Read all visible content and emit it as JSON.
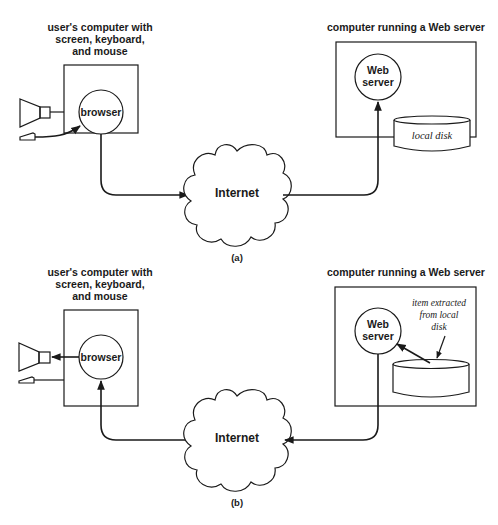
{
  "figure": {
    "panels": [
      {
        "id": "a",
        "caption": "(a)",
        "client": {
          "title_lines": [
            "user's computer with",
            "screen, keyboard,",
            "and mouse"
          ],
          "process_label": "browser",
          "devices": [
            "monitor-icon",
            "mouse-icon"
          ]
        },
        "server": {
          "title": "computer running a Web server",
          "process_label_lines": [
            "Web",
            "server"
          ],
          "disk_label": "local disk"
        },
        "network": {
          "label": "Internet"
        },
        "flow": "mouse → browser → Internet → Web server"
      },
      {
        "id": "b",
        "caption": "(b)",
        "client": {
          "title_lines": [
            "user's computer with",
            "screen, keyboard,",
            "and mouse"
          ],
          "process_label": "browser",
          "devices": [
            "monitor-icon",
            "mouse-icon"
          ]
        },
        "server": {
          "title": "computer running a Web server",
          "process_label_lines": [
            "Web",
            "server"
          ],
          "disk_annotation_lines": [
            "item extracted",
            "from local",
            "disk"
          ]
        },
        "network": {
          "label": "Internet"
        },
        "flow": "local disk → Web server → Internet → browser → screen"
      }
    ]
  }
}
